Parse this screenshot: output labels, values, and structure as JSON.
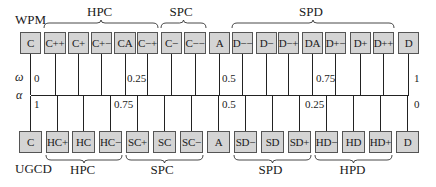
{
  "figure": {
    "top_scheme": "WPM",
    "bottom_scheme": "UGCD",
    "omega_symbol": "ω",
    "alpha_symbol": "α"
  },
  "top_groups": [
    {
      "label": "HPC",
      "x1": 44,
      "x2": 158
    },
    {
      "label": "SPC",
      "x1": 161,
      "x2": 206
    },
    {
      "label": "SPD",
      "x1": 232,
      "x2": 394
    }
  ],
  "bottom_groups": [
    {
      "label": "HPC",
      "x1": 46,
      "x2": 122
    },
    {
      "label": "SPC",
      "x1": 126,
      "x2": 203
    },
    {
      "label": "SPD",
      "x1": 234,
      "x2": 311
    },
    {
      "label": "HPD",
      "x1": 315,
      "x2": 392
    }
  ],
  "top_boxes": [
    {
      "label": "C",
      "x": 20,
      "w": 21
    },
    {
      "label": "C++",
      "x": 44,
      "w": 22
    },
    {
      "label": "C+",
      "x": 68,
      "w": 21
    },
    {
      "label": "C+−",
      "x": 91,
      "w": 21
    },
    {
      "label": "CA",
      "x": 114,
      "w": 22
    },
    {
      "label": "C−+",
      "x": 137,
      "w": 21
    },
    {
      "label": "C−",
      "x": 161,
      "w": 21
    },
    {
      "label": "C−−",
      "x": 184,
      "w": 22
    },
    {
      "label": "A",
      "x": 209,
      "w": 21
    },
    {
      "label": "D−−",
      "x": 232,
      "w": 21
    },
    {
      "label": "D−",
      "x": 256,
      "w": 21
    },
    {
      "label": "D−+",
      "x": 278,
      "w": 21
    },
    {
      "label": "DA",
      "x": 302,
      "w": 21
    },
    {
      "label": "D+−",
      "x": 325,
      "w": 21
    },
    {
      "label": "D+",
      "x": 350,
      "w": 21
    },
    {
      "label": "D++",
      "x": 373,
      "w": 21
    },
    {
      "label": "D",
      "x": 398,
      "w": 21
    }
  ],
  "bottom_boxes": [
    {
      "label": "C",
      "x": 19,
      "w": 23
    },
    {
      "label": "HC+",
      "x": 46,
      "w": 23
    },
    {
      "label": "HC",
      "x": 72,
      "w": 23
    },
    {
      "label": "HC−",
      "x": 99,
      "w": 23
    },
    {
      "label": "SC+",
      "x": 126,
      "w": 23
    },
    {
      "label": "SC",
      "x": 153,
      "w": 23
    },
    {
      "label": "SC−",
      "x": 180,
      "w": 23
    },
    {
      "label": "A",
      "x": 207,
      "w": 23
    },
    {
      "label": "SD−",
      "x": 234,
      "w": 23
    },
    {
      "label": "SD",
      "x": 261,
      "w": 23
    },
    {
      "label": "SD+",
      "x": 288,
      "w": 23
    },
    {
      "label": "HD−",
      "x": 315,
      "w": 23
    },
    {
      "label": "HD",
      "x": 342,
      "w": 23
    },
    {
      "label": "HD+",
      "x": 369,
      "w": 23
    },
    {
      "label": "D",
      "x": 396,
      "w": 23
    }
  ],
  "omega_ticks": [
    {
      "label": "0",
      "x": 34
    },
    {
      "label": "0.25",
      "x": 127
    },
    {
      "label": "0.5",
      "x": 222
    },
    {
      "label": "0.75",
      "x": 316
    },
    {
      "label": "1",
      "x": 414
    }
  ],
  "alpha_ticks": [
    {
      "label": "1",
      "x": 34
    },
    {
      "label": "0.75",
      "x": 114
    },
    {
      "label": "0.5",
      "x": 222
    },
    {
      "label": "0.25",
      "x": 305
    },
    {
      "label": "0",
      "x": 414
    }
  ],
  "colors": {
    "box_fill": "#d4d4d4",
    "box_border": "#555555",
    "line": "#222222",
    "text": "#1a1a1a"
  }
}
